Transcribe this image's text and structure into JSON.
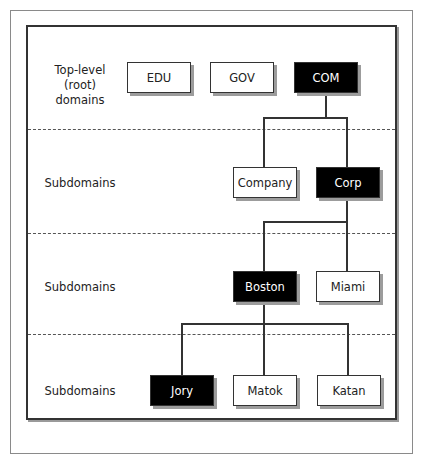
{
  "diagram": {
    "levels": [
      {
        "label_line1": "Top-level",
        "label_line2": "(root) domains"
      },
      {
        "label": "Subdomains"
      },
      {
        "label": "Subdomains"
      },
      {
        "label": "Subdomains"
      }
    ],
    "nodes": {
      "edu": {
        "label": "EDU",
        "style": "light"
      },
      "gov": {
        "label": "GOV",
        "style": "light"
      },
      "com": {
        "label": "COM",
        "style": "dark"
      },
      "company": {
        "label": "Company",
        "style": "light"
      },
      "corp": {
        "label": "Corp",
        "style": "dark"
      },
      "boston": {
        "label": "Boston",
        "style": "dark"
      },
      "miami": {
        "label": "Miami",
        "style": "light"
      },
      "jory": {
        "label": "Jory",
        "style": "dark"
      },
      "matok": {
        "label": "Matok",
        "style": "light"
      },
      "katan": {
        "label": "Katan",
        "style": "light"
      }
    },
    "edges": [
      [
        "COM",
        "Company"
      ],
      [
        "COM",
        "Corp"
      ],
      [
        "Corp",
        "Boston"
      ],
      [
        "Corp",
        "Miami"
      ],
      [
        "Boston",
        "Jory"
      ],
      [
        "Boston",
        "Matok"
      ],
      [
        "Boston",
        "Katan"
      ]
    ],
    "colors": {
      "highlight": "#000000",
      "normal": "#ffffff",
      "line": "#333333"
    }
  }
}
